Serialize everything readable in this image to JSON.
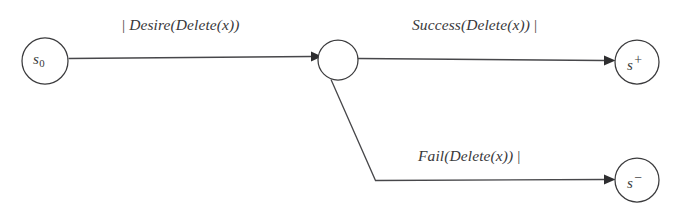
{
  "figure": {
    "background_color": "#ffffff",
    "stroke_color": "#47474a",
    "text_color": "#39393b"
  },
  "nodes": [
    {
      "id": "s0",
      "label_base": "s",
      "label_sub": "0",
      "label_sup": "",
      "role": "initial-state",
      "cx": 45,
      "cy": 61,
      "r": 23
    },
    {
      "id": "junction",
      "label_base": "",
      "label_sub": "",
      "label_sup": "",
      "role": "intermediate-state",
      "cx": 338,
      "cy": 60,
      "r": 20
    },
    {
      "id": "splus",
      "label_base": "s",
      "label_sub": "",
      "label_sup": "+",
      "role": "success-state",
      "cx": 637,
      "cy": 62,
      "r": 22
    },
    {
      "id": "sminus",
      "label_base": "s",
      "label_sub": "",
      "label_sup": "−",
      "role": "failure-state",
      "cx": 637,
      "cy": 180,
      "r": 22
    }
  ],
  "edges": [
    {
      "id": "desire",
      "from": "s0",
      "to": "junction",
      "pipe_before": "|",
      "label": "Desire(Delete(x))",
      "pipe_after": ""
    },
    {
      "id": "success",
      "from": "junction",
      "to": "splus",
      "pipe_before": "",
      "label": "Success(Delete(x))",
      "pipe_after": "|"
    },
    {
      "id": "fail",
      "from": "junction",
      "to": "sminus",
      "pipe_before": "",
      "label": "Fail(Delete(x))",
      "pipe_after": "|"
    }
  ]
}
